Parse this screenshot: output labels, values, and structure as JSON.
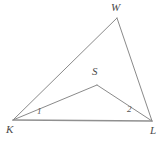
{
  "figure": {
    "width": 164,
    "height": 141,
    "background_color": "#ffffff",
    "line_color": "#8a8a8a",
    "baseline_color": "#909090",
    "text_color": "#4a4a4a",
    "vertices": [
      {
        "name": "K",
        "label": "K",
        "x": 13,
        "y": 120,
        "label_x": 6,
        "label_y": 124
      },
      {
        "name": "L",
        "label": "L",
        "x": 152,
        "y": 121,
        "label_x": 150,
        "label_y": 125
      },
      {
        "name": "W",
        "label": "W",
        "x": 117,
        "y": 18,
        "label_x": 111,
        "label_y": 2
      },
      {
        "name": "S",
        "label": "S",
        "x": 97,
        "y": 85,
        "label_x": 92,
        "label_y": 66
      }
    ],
    "segments": [
      {
        "name": "segment-kw",
        "from": "K",
        "to": "W",
        "x1": 13,
        "y1": 120,
        "x2": 117,
        "y2": 18,
        "width": 1.0
      },
      {
        "name": "segment-wl",
        "from": "W",
        "to": "L",
        "x1": 117,
        "y1": 18,
        "x2": 152,
        "y2": 121,
        "width": 1.0
      },
      {
        "name": "segment-kl",
        "from": "K",
        "to": "L",
        "x1": 13,
        "y1": 120,
        "x2": 152,
        "y2": 121,
        "width": 1.4
      },
      {
        "name": "segment-ks",
        "from": "K",
        "to": "S",
        "x1": 13,
        "y1": 120,
        "x2": 97,
        "y2": 85,
        "width": 1.0
      },
      {
        "name": "segment-sl",
        "from": "S",
        "to": "L",
        "x1": 97,
        "y1": 85,
        "x2": 152,
        "y2": 121,
        "width": 1.0
      }
    ],
    "angle_labels": [
      {
        "name": "angle-1",
        "label": "1",
        "at_vertex": "K",
        "x": 37,
        "y": 107
      },
      {
        "name": "angle-2",
        "label": "2",
        "at_vertex": "L",
        "x": 127,
        "y": 105
      }
    ]
  }
}
